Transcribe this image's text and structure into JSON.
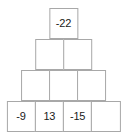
{
  "figure": {
    "kind": "number-pyramid",
    "rows": [
      {
        "index": 1,
        "cells": [
          {
            "value": "-22",
            "filled": true
          }
        ]
      },
      {
        "index": 2,
        "cells": [
          {
            "value": "",
            "filled": false
          },
          {
            "value": "",
            "filled": false
          }
        ]
      },
      {
        "index": 3,
        "cells": [
          {
            "value": "",
            "filled": false
          },
          {
            "value": "",
            "filled": false
          },
          {
            "value": "",
            "filled": false
          }
        ]
      },
      {
        "index": 4,
        "cells": [
          {
            "value": "-9",
            "filled": true
          },
          {
            "value": "13",
            "filled": true
          },
          {
            "value": "-15",
            "filled": true
          },
          {
            "value": "",
            "filled": false
          }
        ]
      }
    ],
    "colors": {
      "border": "#a8a8a8",
      "text": "#1a1a1a",
      "background": "#ffffff"
    }
  }
}
